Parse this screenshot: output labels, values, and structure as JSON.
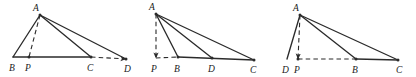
{
  "sheet": {
    "width": 416,
    "height": 77,
    "background": "#ffffff",
    "stroke_color": "#2b2b2b",
    "label_color": "#1a1a1a",
    "description": "Three geometry figures of triangles with an apex A, a base line, a dashed altitude to foot P, and extra cevian/extension segments."
  },
  "figures": [
    {
      "id": "figure-1",
      "name": "triangle-abc-with-extension-to-d",
      "panel": {
        "left": 0,
        "width": 140
      },
      "points": {
        "A": {
          "x": 40,
          "y": 15,
          "label": "A",
          "label_x": 33,
          "label_y": 11
        },
        "B": {
          "x": 13,
          "y": 57,
          "label": "B",
          "label_x": 9,
          "label_y": 71
        },
        "P": {
          "x": 29,
          "y": 57,
          "label": "P",
          "label_x": 25,
          "label_y": 71
        },
        "C": {
          "x": 91,
          "y": 57,
          "label": "C",
          "label_x": 87,
          "label_y": 71
        },
        "D": {
          "x": 126,
          "y": 59,
          "label": "D",
          "label_x": 124,
          "label_y": 72
        }
      },
      "solid_segments": [
        {
          "name": "side-AB",
          "from": "A",
          "to": "B"
        },
        {
          "name": "side-AC",
          "from": "A",
          "to": "C"
        },
        {
          "name": "side-AD",
          "from": "A",
          "to": "D"
        },
        {
          "name": "base-BC",
          "from": "B",
          "to": "C"
        }
      ],
      "dashed_segments": [
        {
          "name": "altitude-AP",
          "from": "A",
          "to": "P"
        },
        {
          "name": "extension-CD",
          "from": "C",
          "to": "D",
          "arrow": true
        }
      ],
      "dot_points": [
        "A",
        "P",
        "C",
        "D"
      ]
    },
    {
      "id": "figure-2",
      "name": "triangle-abc-with-foot-p-outside",
      "panel": {
        "left": 140,
        "width": 140
      },
      "points": {
        "A": {
          "x": 156,
          "y": 14,
          "label": "A",
          "label_x": 149,
          "label_y": 10
        },
        "P": {
          "x": 156,
          "y": 58,
          "label": "P",
          "label_x": 151,
          "label_y": 72
        },
        "B": {
          "x": 178,
          "y": 57,
          "label": "B",
          "label_x": 174,
          "label_y": 72
        },
        "D": {
          "x": 212,
          "y": 58,
          "label": "D",
          "label_x": 208,
          "label_y": 72
        },
        "C": {
          "x": 254,
          "y": 60,
          "label": "C",
          "label_x": 250,
          "label_y": 73
        }
      },
      "solid_segments": [
        {
          "name": "side-AB",
          "from": "A",
          "to": "B"
        },
        {
          "name": "cevian-AD",
          "from": "A",
          "to": "D"
        },
        {
          "name": "side-AC",
          "from": "A",
          "to": "C"
        },
        {
          "name": "base-BC",
          "from": "B",
          "to": "C"
        }
      ],
      "dashed_segments": [
        {
          "name": "altitude-AP",
          "from": "A",
          "to": "P",
          "arrow": true
        },
        {
          "name": "extension-PB",
          "from": "P",
          "to": "B"
        }
      ],
      "dot_points": [
        "A",
        "B",
        "D",
        "C"
      ]
    },
    {
      "id": "figure-3",
      "name": "triangle-abc-with-point-d-left-of-p",
      "panel": {
        "left": 280,
        "width": 136
      },
      "points": {
        "A": {
          "x": 300,
          "y": 15,
          "label": "A",
          "label_x": 293,
          "label_y": 11
        },
        "D": {
          "x": 287,
          "y": 59,
          "label": "D",
          "label_x": 282,
          "label_y": 73
        },
        "P": {
          "x": 298,
          "y": 59,
          "label": "P",
          "label_x": 294,
          "label_y": 73
        },
        "B": {
          "x": 356,
          "y": 59,
          "label": "B",
          "label_x": 352,
          "label_y": 73
        },
        "C": {
          "x": 398,
          "y": 60,
          "label": "C",
          "label_x": 396,
          "label_y": 73
        }
      },
      "solid_segments": [
        {
          "name": "side-AD",
          "from": "A",
          "to": "D"
        },
        {
          "name": "side-AB",
          "from": "A",
          "to": "B"
        },
        {
          "name": "side-AC",
          "from": "A",
          "to": "C"
        },
        {
          "name": "base-BC",
          "from": "B",
          "to": "C"
        }
      ],
      "dashed_segments": [
        {
          "name": "altitude-AP",
          "from": "A",
          "to": "P",
          "arrow": true
        },
        {
          "name": "extension-PB",
          "from": "P",
          "to": "B"
        }
      ],
      "dot_points": [
        "A",
        "P",
        "B",
        "C"
      ]
    }
  ]
}
